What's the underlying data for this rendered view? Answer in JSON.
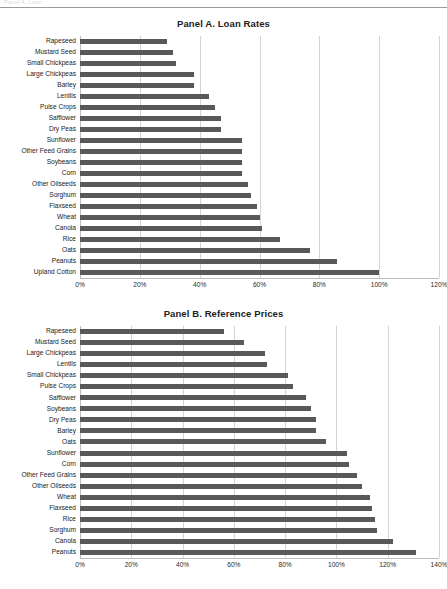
{
  "document": {
    "cutoff_header": "Panel A. Loan",
    "bar_color": "#595959",
    "gridline_color": "#d4d4d4"
  },
  "panels": [
    {
      "id": "panel-a",
      "title": "Panel A. Loan Rates",
      "axis": {
        "min": 0,
        "max": 120,
        "step": 20,
        "ticks": [
          "0%",
          "20%",
          "40%",
          "60%",
          "80%",
          "100%",
          "120%"
        ],
        "tick_values": [
          0,
          20,
          40,
          60,
          80,
          100,
          120
        ]
      },
      "categories": [
        "Rapeseed",
        "Mustard Seed",
        "Small Chickpeas",
        "Large Chickpeas",
        "Barley",
        "Lentils",
        "Pulse Crops",
        "Safflower",
        "Dry Peas",
        "Sunflower",
        "Other Feed Grains",
        "Soybeans",
        "Corn",
        "Other Oilseeds",
        "Sorghum",
        "Flaxseed",
        "Wheat",
        "Canola",
        "Rice",
        "Oats",
        "Peanuts",
        "Upland Cotton"
      ],
      "values": [
        29,
        31,
        32,
        38,
        38,
        43,
        45,
        47,
        47,
        54,
        54,
        54,
        54,
        56,
        57,
        59,
        60,
        61,
        67,
        77,
        86,
        100
      ]
    },
    {
      "id": "panel-b",
      "title": "Panel B. Reference Prices",
      "axis": {
        "min": 0,
        "max": 140,
        "step": 20,
        "ticks": [
          "0%",
          "20%",
          "40%",
          "60%",
          "80%",
          "100%",
          "120%",
          "140%"
        ],
        "tick_values": [
          0,
          20,
          40,
          60,
          80,
          100,
          120,
          140
        ]
      },
      "categories": [
        "Rapeseed",
        "Mustard Seed",
        "Large Chickpeas",
        "Lentils",
        "Small Chickpeas",
        "Pulse Crops",
        "Safflower",
        "Soybeans",
        "Dry Peas",
        "Barley",
        "Oats",
        "Sunflower",
        "Corn",
        "Other Feed Grains",
        "Other Oilseeds",
        "Wheat",
        "Flaxseed",
        "Rice",
        "Sorghum",
        "Canola",
        "Peanuts"
      ],
      "values": [
        56,
        64,
        72,
        73,
        81,
        83,
        88,
        90,
        92,
        92,
        96,
        104,
        105,
        108,
        110,
        113,
        114,
        115,
        116,
        122,
        131
      ]
    }
  ],
  "chart_data": [
    {
      "type": "bar",
      "orientation": "horizontal",
      "title": "Panel A. Loan Rates",
      "xlabel": "",
      "ylabel": "",
      "xlim": [
        0,
        120
      ],
      "grid": true,
      "legend": "none",
      "categories": [
        "Rapeseed",
        "Mustard Seed",
        "Small Chickpeas",
        "Large Chickpeas",
        "Barley",
        "Lentils",
        "Pulse Crops",
        "Safflower",
        "Dry Peas",
        "Sunflower",
        "Other Feed Grains",
        "Soybeans",
        "Corn",
        "Other Oilseeds",
        "Sorghum",
        "Flaxseed",
        "Wheat",
        "Canola",
        "Rice",
        "Oats",
        "Peanuts",
        "Upland Cotton"
      ],
      "values": [
        29,
        31,
        32,
        38,
        38,
        43,
        45,
        47,
        47,
        54,
        54,
        54,
        54,
        56,
        57,
        59,
        60,
        61,
        67,
        77,
        86,
        100
      ],
      "tick_labels": [
        "0%",
        "20%",
        "40%",
        "60%",
        "80%",
        "100%",
        "120%"
      ]
    },
    {
      "type": "bar",
      "orientation": "horizontal",
      "title": "Panel B. Reference Prices",
      "xlabel": "",
      "ylabel": "",
      "xlim": [
        0,
        140
      ],
      "grid": true,
      "legend": "none",
      "categories": [
        "Rapeseed",
        "Mustard Seed",
        "Large Chickpeas",
        "Lentils",
        "Small Chickpeas",
        "Pulse Crops",
        "Safflower",
        "Soybeans",
        "Dry Peas",
        "Barley",
        "Oats",
        "Sunflower",
        "Corn",
        "Other Feed Grains",
        "Other Oilseeds",
        "Wheat",
        "Flaxseed",
        "Rice",
        "Sorghum",
        "Canola",
        "Peanuts"
      ],
      "values": [
        56,
        64,
        72,
        73,
        81,
        83,
        88,
        90,
        92,
        92,
        96,
        104,
        105,
        108,
        110,
        113,
        114,
        115,
        116,
        122,
        131
      ],
      "tick_labels": [
        "0%",
        "20%",
        "40%",
        "60%",
        "80%",
        "100%",
        "120%",
        "140%"
      ]
    }
  ]
}
